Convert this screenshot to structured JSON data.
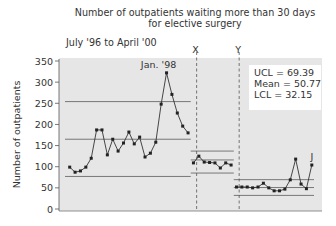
{
  "chart_data": {
    "type": "line",
    "title": "Number of outpatients waiting more than 30 days for elective surgery",
    "title_lines": [
      "Number of outpatients waiting more than 30 days",
      "for elective surgery"
    ],
    "subtitle": "July '96 to April '00",
    "xlabel": "",
    "ylabel": "Number of outpatients",
    "ylim": [
      0,
      350
    ],
    "yticks": [
      0,
      50,
      100,
      150,
      200,
      250,
      300,
      350
    ],
    "grid": false,
    "phase_markers": [
      {
        "label": "X",
        "after_index": 24
      },
      {
        "label": "Y",
        "after_index": 32
      }
    ],
    "annotations": [
      {
        "label": "Jan. '98",
        "index": 18
      },
      {
        "label": "J",
        "index": 45
      },
      {
        "label": "A",
        "index": 48
      }
    ],
    "series": [
      {
        "name": "Outpatients waiting > 30 days",
        "segments": [
          {
            "phase": 1,
            "values": [
              99,
              87,
              90,
              99,
              120,
              187,
              187,
              128,
              165,
              137,
              156,
              182,
              154,
              170,
              123,
              132,
              158,
              248,
              322,
              271,
              227,
              196,
              180
            ],
            "ucl": 254,
            "mean": 165,
            "lcl": 77
          },
          {
            "phase": 2,
            "values": [
              109,
              125,
              111,
              110,
              109,
              97,
              109,
              104
            ],
            "ucl": 137,
            "mean": 116,
            "lcl": 85
          },
          {
            "phase": 3,
            "values": [
              52,
              52,
              52,
              50,
              52,
              61,
              50,
              43,
              43,
              47,
              69,
              118,
              59,
              48,
              104
            ],
            "ucl": 69.39,
            "mean": 50.77,
            "lcl": 32.15
          }
        ]
      }
    ],
    "legend_box": [
      "UCL = 69.39",
      "Mean = 50.77",
      "LCL = 32.15"
    ]
  }
}
